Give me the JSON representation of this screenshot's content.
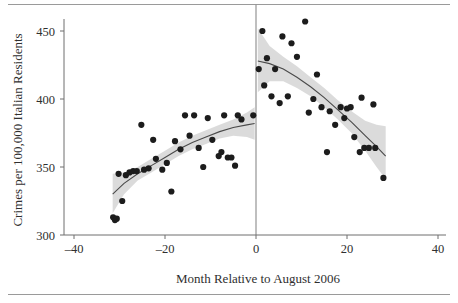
{
  "chart_data": {
    "type": "scatter",
    "title": "",
    "subtitle": "",
    "xlabel": "Month Relative to August 2006",
    "ylabel": "Crimes per 100,000 Italian Residents",
    "xlim": [
      -46,
      46
    ],
    "ylim": [
      293,
      462
    ],
    "xticks": [
      -40,
      -20,
      0,
      20,
      40
    ],
    "xtick_labels": [
      "–40",
      "–20",
      "0",
      "20",
      "40"
    ],
    "yticks": [
      300,
      350,
      400,
      450
    ],
    "ytick_labels": [
      "300",
      "350",
      "400",
      "450"
    ],
    "grid": false,
    "legend": null,
    "legend_position": "none",
    "annotations": [
      {
        "name": "cutoff-line",
        "x": 0,
        "description": "vertical reference line at month 0 (August 2006 collective pardon)"
      }
    ],
    "points": [
      {
        "x": -31.4,
        "y": 313
      },
      {
        "x": -31.0,
        "y": 311
      },
      {
        "x": -30.6,
        "y": 312
      },
      {
        "x": -30.2,
        "y": 345
      },
      {
        "x": -29.4,
        "y": 325
      },
      {
        "x": -28.6,
        "y": 344
      },
      {
        "x": -27.8,
        "y": 346
      },
      {
        "x": -27.0,
        "y": 347
      },
      {
        "x": -26.2,
        "y": 347
      },
      {
        "x": -25.2,
        "y": 381
      },
      {
        "x": -24.6,
        "y": 348
      },
      {
        "x": -23.6,
        "y": 349
      },
      {
        "x": -22.6,
        "y": 370
      },
      {
        "x": -22.0,
        "y": 356
      },
      {
        "x": -20.6,
        "y": 348
      },
      {
        "x": -19.6,
        "y": 353
      },
      {
        "x": -18.6,
        "y": 332
      },
      {
        "x": -17.8,
        "y": 369
      },
      {
        "x": -16.6,
        "y": 363
      },
      {
        "x": -15.6,
        "y": 388
      },
      {
        "x": -14.6,
        "y": 373
      },
      {
        "x": -13.6,
        "y": 388
      },
      {
        "x": -12.6,
        "y": 364
      },
      {
        "x": -11.6,
        "y": 350
      },
      {
        "x": -10.6,
        "y": 386
      },
      {
        "x": -9.6,
        "y": 370
      },
      {
        "x": -8.2,
        "y": 358
      },
      {
        "x": -7.6,
        "y": 361
      },
      {
        "x": -7.0,
        "y": 388
      },
      {
        "x": -6.2,
        "y": 357
      },
      {
        "x": -5.4,
        "y": 357
      },
      {
        "x": -4.6,
        "y": 351
      },
      {
        "x": -4.0,
        "y": 388
      },
      {
        "x": -3.2,
        "y": 385
      },
      {
        "x": -0.6,
        "y": 388
      },
      {
        "x": 0.6,
        "y": 422
      },
      {
        "x": 1.4,
        "y": 450
      },
      {
        "x": 1.8,
        "y": 410
      },
      {
        "x": 2.4,
        "y": 430
      },
      {
        "x": 3.4,
        "y": 402
      },
      {
        "x": 4.2,
        "y": 422
      },
      {
        "x": 5.2,
        "y": 397
      },
      {
        "x": 5.8,
        "y": 446
      },
      {
        "x": 7.0,
        "y": 402
      },
      {
        "x": 7.8,
        "y": 441
      },
      {
        "x": 9.0,
        "y": 431
      },
      {
        "x": 10.8,
        "y": 457
      },
      {
        "x": 11.6,
        "y": 390
      },
      {
        "x": 12.6,
        "y": 400
      },
      {
        "x": 13.4,
        "y": 418
      },
      {
        "x": 14.4,
        "y": 394
      },
      {
        "x": 15.6,
        "y": 361
      },
      {
        "x": 16.2,
        "y": 391
      },
      {
        "x": 17.4,
        "y": 381
      },
      {
        "x": 18.6,
        "y": 394
      },
      {
        "x": 19.4,
        "y": 386
      },
      {
        "x": 20.0,
        "y": 393
      },
      {
        "x": 20.8,
        "y": 394
      },
      {
        "x": 21.6,
        "y": 372
      },
      {
        "x": 22.8,
        "y": 361
      },
      {
        "x": 23.2,
        "y": 401
      },
      {
        "x": 23.8,
        "y": 364
      },
      {
        "x": 24.8,
        "y": 364
      },
      {
        "x": 25.8,
        "y": 396
      },
      {
        "x": 26.2,
        "y": 364
      },
      {
        "x": 28.0,
        "y": 342
      }
    ],
    "series": [
      {
        "name": "fit-left",
        "type": "line",
        "x_range": [
          -31.5,
          -0.3
        ],
        "fit": [
          {
            "x": -31.5,
            "y": 330
          },
          {
            "x": -29.0,
            "y": 338
          },
          {
            "x": -26.0,
            "y": 345
          },
          {
            "x": -23.0,
            "y": 351
          },
          {
            "x": -20.0,
            "y": 357
          },
          {
            "x": -17.0,
            "y": 363
          },
          {
            "x": -14.0,
            "y": 368
          },
          {
            "x": -11.0,
            "y": 372
          },
          {
            "x": -8.0,
            "y": 376
          },
          {
            "x": -5.0,
            "y": 379
          },
          {
            "x": -2.0,
            "y": 381
          },
          {
            "x": -0.3,
            "y": 382
          }
        ],
        "ci_upper": [
          {
            "x": -31.5,
            "y": 345
          },
          {
            "x": -29.0,
            "y": 346
          },
          {
            "x": -26.0,
            "y": 350
          },
          {
            "x": -23.0,
            "y": 356
          },
          {
            "x": -20.0,
            "y": 362
          },
          {
            "x": -17.0,
            "y": 368
          },
          {
            "x": -14.0,
            "y": 373
          },
          {
            "x": -11.0,
            "y": 377
          },
          {
            "x": -8.0,
            "y": 381
          },
          {
            "x": -5.0,
            "y": 385
          },
          {
            "x": -2.0,
            "y": 390
          },
          {
            "x": -0.3,
            "y": 394
          }
        ],
        "ci_lower": [
          {
            "x": -31.5,
            "y": 316
          },
          {
            "x": -29.0,
            "y": 330
          },
          {
            "x": -26.0,
            "y": 340
          },
          {
            "x": -23.0,
            "y": 346
          },
          {
            "x": -20.0,
            "y": 352
          },
          {
            "x": -17.0,
            "y": 358
          },
          {
            "x": -14.0,
            "y": 363
          },
          {
            "x": -11.0,
            "y": 367
          },
          {
            "x": -8.0,
            "y": 371
          },
          {
            "x": -5.0,
            "y": 373
          },
          {
            "x": -2.0,
            "y": 372
          },
          {
            "x": -0.3,
            "y": 370
          }
        ]
      },
      {
        "name": "fit-right",
        "type": "line",
        "x_range": [
          0.4,
          28.5
        ],
        "fit": [
          {
            "x": 0.4,
            "y": 428
          },
          {
            "x": 3.0,
            "y": 426
          },
          {
            "x": 6.0,
            "y": 422
          },
          {
            "x": 9.0,
            "y": 416
          },
          {
            "x": 12.0,
            "y": 409
          },
          {
            "x": 15.0,
            "y": 401
          },
          {
            "x": 18.0,
            "y": 392
          },
          {
            "x": 21.0,
            "y": 383
          },
          {
            "x": 24.0,
            "y": 373
          },
          {
            "x": 26.5,
            "y": 365
          },
          {
            "x": 28.5,
            "y": 358
          }
        ],
        "ci_upper": [
          {
            "x": 0.4,
            "y": 452
          },
          {
            "x": 3.0,
            "y": 439
          },
          {
            "x": 6.0,
            "y": 431
          },
          {
            "x": 9.0,
            "y": 424
          },
          {
            "x": 12.0,
            "y": 416
          },
          {
            "x": 15.0,
            "y": 408
          },
          {
            "x": 18.0,
            "y": 399
          },
          {
            "x": 21.0,
            "y": 391
          },
          {
            "x": 24.0,
            "y": 384
          },
          {
            "x": 26.5,
            "y": 381
          },
          {
            "x": 28.5,
            "y": 380
          }
        ],
        "ci_lower": [
          {
            "x": 0.4,
            "y": 405
          },
          {
            "x": 3.0,
            "y": 413
          },
          {
            "x": 6.0,
            "y": 413
          },
          {
            "x": 9.0,
            "y": 408
          },
          {
            "x": 12.0,
            "y": 402
          },
          {
            "x": 15.0,
            "y": 394
          },
          {
            "x": 18.0,
            "y": 385
          },
          {
            "x": 21.0,
            "y": 375
          },
          {
            "x": 24.0,
            "y": 362
          },
          {
            "x": 26.5,
            "y": 350
          },
          {
            "x": 28.5,
            "y": 341
          }
        ]
      }
    ],
    "colors": {
      "point": "#1c1c1c",
      "fit_line": "#4a4a4a",
      "ci_band": "#d9d9d9",
      "axis": "#6f6f6f",
      "cutoff": "#8a8a8a",
      "text": "#2f2f2f",
      "rule": "#9a9a9a"
    }
  }
}
